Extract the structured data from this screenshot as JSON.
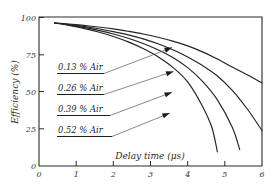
{
  "chart_data": {
    "type": "line",
    "title": "",
    "xlabel": "Delay time (μs)",
    "ylabel": "Efficiency (%)",
    "xlim": [
      0,
      6
    ],
    "ylim": [
      0,
      100
    ],
    "xticks": [
      0,
      1,
      2,
      3,
      4,
      5,
      6
    ],
    "xtick_labels": [
      "0",
      "1",
      "2",
      "3",
      "4",
      "5",
      "6"
    ],
    "yticks": [
      0,
      25,
      50,
      75,
      100
    ],
    "ytick_labels": [
      "0",
      "25",
      "50",
      "75",
      "100"
    ],
    "grid": false,
    "legend_position": "inline-annotations",
    "series": [
      {
        "name": "0.13 % Air",
        "x": [
          0.42,
          0.8,
          1.2,
          1.6,
          2.0,
          2.4,
          2.8,
          3.2,
          3.6,
          4.0,
          4.4,
          4.8,
          5.2,
          5.6,
          6.0
        ],
        "y": [
          96.0,
          95.3,
          94.4,
          93.3,
          92.0,
          90.4,
          88.6,
          86.4,
          83.8,
          80.6,
          76.6,
          71.8,
          66.4,
          61.2,
          55.8
        ]
      },
      {
        "name": "0.26 % Air",
        "x": [
          0.42,
          0.8,
          1.2,
          1.6,
          2.0,
          2.4,
          2.8,
          3.2,
          3.6,
          4.0,
          4.4,
          4.8,
          5.2,
          5.6,
          6.0
        ],
        "y": [
          96.0,
          95.0,
          93.7,
          92.1,
          90.2,
          88.0,
          85.3,
          82.0,
          78.0,
          73.2,
          67.4,
          60.4,
          50.8,
          38.4,
          23.8
        ]
      },
      {
        "name": "0.39 % Air",
        "x": [
          0.42,
          0.8,
          1.2,
          1.6,
          2.0,
          2.4,
          2.8,
          3.2,
          3.6,
          4.0,
          4.4,
          4.8,
          5.2,
          5.4
        ],
        "y": [
          96.0,
          94.7,
          93.0,
          91.0,
          88.6,
          85.7,
          82.2,
          78.0,
          72.8,
          66.0,
          56.8,
          44.4,
          26.0,
          11.0
        ]
      },
      {
        "name": "0.52 % Air",
        "x": [
          0.42,
          0.8,
          1.2,
          1.6,
          2.0,
          2.4,
          2.8,
          3.2,
          3.6,
          4.0,
          4.4,
          4.65,
          4.8
        ],
        "y": [
          96.0,
          94.4,
          92.4,
          89.9,
          86.9,
          83.3,
          78.8,
          73.3,
          66.2,
          56.4,
          40.0,
          26.0,
          9.5
        ]
      }
    ],
    "annotations": [
      {
        "label": "0.13 % Air",
        "target_x": 3.58,
        "target_y": 79.5
      },
      {
        "label": "0.26 % Air",
        "target_x": 3.62,
        "target_y": 63.5
      },
      {
        "label": "0.39 % Air",
        "target_x": 3.58,
        "target_y": 49.5
      },
      {
        "label": "0.52 % Air",
        "target_x": 3.52,
        "target_y": 35.5
      }
    ]
  },
  "annotation_labels": [
    "0.13 % Air",
    "0.26 % Air",
    "0.39 % Air",
    "0.52 % Air"
  ],
  "colors": {
    "curve": "#222222",
    "axis": "#2a2a2a",
    "leader": "#555555",
    "background": "#ffffff"
  }
}
